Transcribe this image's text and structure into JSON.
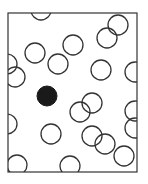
{
  "diagram": {
    "frame": {
      "x": 8,
      "y": 13,
      "width": 129,
      "height": 159,
      "stroke": "#333333"
    },
    "circle_radius": 10,
    "stroke_color": "#333333",
    "fill_color": "#1a1a1a",
    "open_circles": [
      {
        "cx": 41,
        "cy": 10
      },
      {
        "cx": 35,
        "cy": 53
      },
      {
        "cx": 73,
        "cy": 45
      },
      {
        "cx": 58,
        "cy": 64
      },
      {
        "cx": 7,
        "cy": 64
      },
      {
        "cx": 15,
        "cy": 77
      },
      {
        "cx": 118,
        "cy": 25
      },
      {
        "cx": 107,
        "cy": 38
      },
      {
        "cx": 101,
        "cy": 70
      },
      {
        "cx": 135,
        "cy": 72
      },
      {
        "cx": 80,
        "cy": 112
      },
      {
        "cx": 92,
        "cy": 103
      },
      {
        "cx": 7,
        "cy": 124
      },
      {
        "cx": 51,
        "cy": 134
      },
      {
        "cx": 92,
        "cy": 136
      },
      {
        "cx": 105,
        "cy": 144
      },
      {
        "cx": 135,
        "cy": 111
      },
      {
        "cx": 135,
        "cy": 128
      },
      {
        "cx": 124,
        "cy": 156
      },
      {
        "cx": 17,
        "cy": 165
      },
      {
        "cx": 70,
        "cy": 166
      }
    ],
    "filled_circles": [
      {
        "cx": 47,
        "cy": 96
      }
    ]
  }
}
